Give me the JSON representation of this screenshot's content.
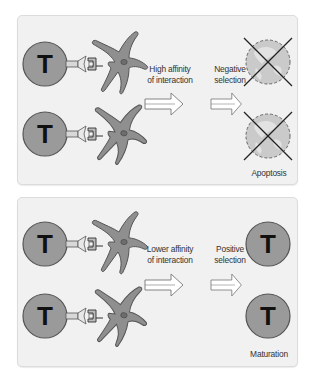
{
  "panels": [
    {
      "id": "negative",
      "affinity_label_line1": "High affinity",
      "affinity_label_line2": "of interaction",
      "selection_label_line1": "Negative",
      "selection_label_line2": "selection",
      "outcome_label": "Apoptosis",
      "outcome_type": "apoptosis"
    },
    {
      "id": "positive",
      "affinity_label_line1": "Lower affinity",
      "affinity_label_line2": "of interaction",
      "selection_label_line1": "Positive",
      "selection_label_line2": "selection",
      "outcome_label": "Maturation",
      "outcome_type": "maturation"
    }
  ],
  "cell_letter": "T",
  "colors": {
    "panel_bg": "#f1f1f1",
    "cell_fill": "#9a9a9a",
    "cell_stroke": "#555555",
    "dead_cell_fill": "#c8c8c8",
    "cross": "#222222"
  }
}
